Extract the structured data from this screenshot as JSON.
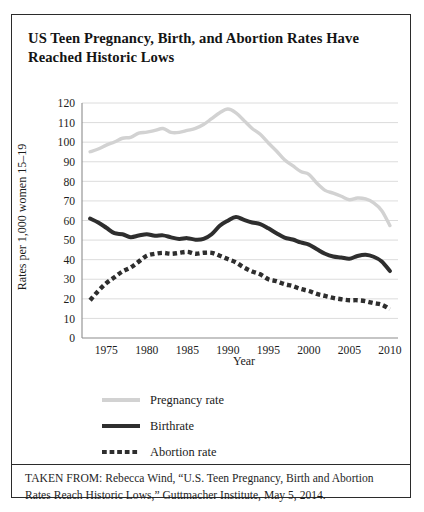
{
  "figure": {
    "title": "US Teen Pregnancy, Birth, and Abortion Rates Have Reached Historic Lows",
    "source_caption": "TAKEN FROM: Rebecca Wind, “U.S. Teen Pregnancy, Birth and Abortion Rates Reach Historic Lows,” Guttmacher Institute, May 5, 2014."
  },
  "colors": {
    "pregnancy": "#d2d2d2",
    "birthrate": "#2e2e2e",
    "abortion": "#2e2e2e",
    "gridline": "#d8d8d8",
    "axis": "#8c8c8c",
    "border": "#2b2b2b",
    "text": "#1a1a1a"
  },
  "legend": {
    "position": "below-plot",
    "items": [
      {
        "label": "Pregnancy rate",
        "style": "solid-light",
        "swatch": "sw-pregnancy"
      },
      {
        "label": "Birthrate",
        "style": "solid-dark",
        "swatch": "sw-birth"
      },
      {
        "label": "Abortion rate",
        "style": "dotted-dark",
        "swatch": "sw-abortion"
      }
    ]
  },
  "chart_data": {
    "type": "line",
    "title": "US Teen Pregnancy, Birth, and Abortion Rates Have Reached Historic Lows",
    "xlabel": "Year",
    "ylabel": "Rates per 1,000 women 15–19",
    "xlim": [
      1972,
      2011
    ],
    "ylim": [
      0,
      120
    ],
    "ytick_step": 10,
    "yticks": [
      0,
      10,
      20,
      30,
      40,
      50,
      60,
      70,
      80,
      90,
      100,
      110,
      120
    ],
    "xticks": [
      1975,
      1980,
      1985,
      1990,
      1995,
      2000,
      2005,
      2010
    ],
    "grid": "horizontal",
    "x": [
      1973,
      1974,
      1975,
      1976,
      1977,
      1978,
      1979,
      1980,
      1981,
      1982,
      1983,
      1984,
      1985,
      1986,
      1987,
      1988,
      1989,
      1990,
      1991,
      1992,
      1993,
      1994,
      1995,
      1996,
      1997,
      1998,
      1999,
      2000,
      2001,
      2002,
      2003,
      2004,
      2005,
      2006,
      2007,
      2008,
      2009,
      2010
    ],
    "series": [
      {
        "name": "Pregnancy rate",
        "color": "#d2d2d2",
        "style": "solid-light",
        "values": [
          95.1,
          96.5,
          98.5,
          100.1,
          102.0,
          102.5,
          104.6,
          105.1,
          106.0,
          107.0,
          105.0,
          105.0,
          106.0,
          107.0,
          109.0,
          112.0,
          115.0,
          116.9,
          115.0,
          111.0,
          107.0,
          104.0,
          99.6,
          95.5,
          91.0,
          88.0,
          85.0,
          83.6,
          79.0,
          75.4,
          74.0,
          72.4,
          70.6,
          71.5,
          71.0,
          69.0,
          65.0,
          57.4
        ]
      },
      {
        "name": "Birthrate",
        "color": "#2e2e2e",
        "style": "solid-dark",
        "values": [
          61.0,
          59.0,
          56.3,
          53.5,
          53.0,
          51.5,
          52.3,
          53.0,
          52.2,
          52.4,
          51.4,
          50.6,
          51.0,
          50.2,
          50.6,
          53.0,
          57.3,
          59.9,
          61.8,
          60.3,
          59.0,
          58.2,
          56.0,
          53.5,
          51.3,
          50.3,
          48.8,
          47.7,
          45.3,
          43.0,
          41.6,
          41.1,
          40.5,
          41.9,
          42.5,
          41.5,
          39.1,
          34.2
        ]
      },
      {
        "name": "Abortion rate",
        "color": "#2e2e2e",
        "style": "dotted-dark",
        "values": [
          19.3,
          24.0,
          28.0,
          31.0,
          34.0,
          36.0,
          39.0,
          42.0,
          43.0,
          43.5,
          43.0,
          43.5,
          44.0,
          43.0,
          43.5,
          43.5,
          42.0,
          40.3,
          38.6,
          36.0,
          34.0,
          32.5,
          30.0,
          29.0,
          27.5,
          26.5,
          25.0,
          24.0,
          22.5,
          21.5,
          20.5,
          19.8,
          19.3,
          19.3,
          18.8,
          17.8,
          17.0,
          14.7
        ]
      }
    ]
  }
}
